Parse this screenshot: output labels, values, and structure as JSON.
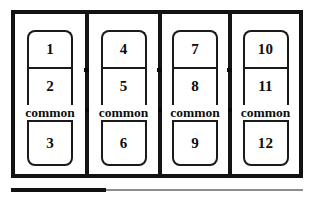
{
  "diagram": {
    "type": "terminal-block-layout",
    "title": "",
    "panel_count": 4,
    "common_label": "common",
    "colors": {
      "outline": "#121212",
      "inner_outline": "#1a1a1a",
      "text": "#0d0d0d",
      "background": "#ffffff",
      "rule": "#8d8d8d"
    },
    "panels": [
      {
        "id": "panel-1",
        "upper_terminals": [
          "1",
          "2"
        ],
        "common": "common",
        "lower_terminals": [
          "3"
        ]
      },
      {
        "id": "panel-2",
        "upper_terminals": [
          "4",
          "5"
        ],
        "common": "common",
        "lower_terminals": [
          "6"
        ]
      },
      {
        "id": "panel-3",
        "upper_terminals": [
          "7",
          "8"
        ],
        "common": "common",
        "lower_terminals": [
          "9"
        ]
      },
      {
        "id": "panel-4",
        "upper_terminals": [
          "10",
          "11"
        ],
        "common": "common",
        "lower_terminals": [
          "12"
        ]
      }
    ]
  }
}
